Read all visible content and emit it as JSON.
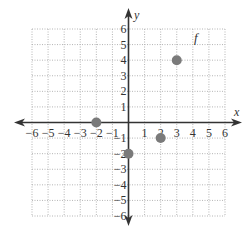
{
  "chart_data": {
    "type": "scatter",
    "title": "",
    "function_label": "f",
    "xlabel": "x",
    "ylabel": "y",
    "xlim": [
      -6,
      6
    ],
    "ylim": [
      -6,
      6
    ],
    "grid": true,
    "x_ticks": [
      -6,
      -5,
      -4,
      -3,
      -2,
      -1,
      1,
      2,
      3,
      4,
      5,
      6
    ],
    "y_ticks": [
      -6,
      -5,
      -4,
      -3,
      -2,
      -1,
      1,
      2,
      3,
      4,
      5,
      6
    ],
    "series": [
      {
        "name": "f",
        "points": [
          {
            "x": -2,
            "y": 0
          },
          {
            "x": 0,
            "y": -2
          },
          {
            "x": 2,
            "y": -1
          },
          {
            "x": 3,
            "y": 4
          }
        ]
      }
    ]
  },
  "colors": {
    "axis": "#333333",
    "grid": "#b5b5b5",
    "point": "#7a7a7a",
    "text": "#333333"
  }
}
